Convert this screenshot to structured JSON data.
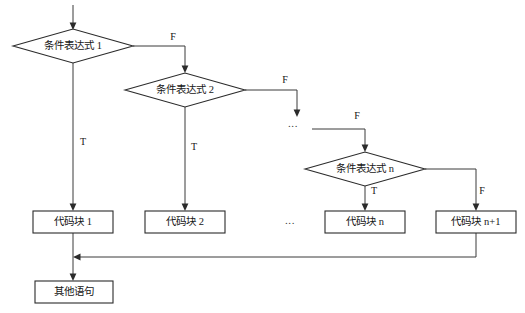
{
  "diagram": {
    "type": "flowchart",
    "title": "",
    "background_color": "#ffffff",
    "line_color": "#3a3a3a",
    "text_color": "#161616",
    "decisions": [
      {
        "id": "cond-1",
        "label": "条件表达式 1",
        "cx": 73,
        "cy": 46,
        "rx": 60,
        "ry": 17
      },
      {
        "id": "cond-2",
        "label": "条件表达式 2",
        "cx": 185,
        "cy": 90,
        "rx": 60,
        "ry": 17
      },
      {
        "id": "cond-n",
        "label": "条件表达式 n",
        "cx": 365,
        "cy": 169,
        "rx": 60,
        "ry": 17
      }
    ],
    "process_blocks": [
      {
        "id": "block-1",
        "label": "代码块 1",
        "x": 33,
        "y": 211,
        "w": 80,
        "h": 22
      },
      {
        "id": "block-2",
        "label": "代码块 2",
        "x": 145,
        "y": 211,
        "w": 80,
        "h": 22
      },
      {
        "id": "block-n",
        "label": "代码块 n",
        "x": 325,
        "y": 211,
        "w": 80,
        "h": 22
      },
      {
        "id": "block-n1",
        "label": "代码块 n+1",
        "x": 436,
        "y": 211,
        "w": 80,
        "h": 22
      },
      {
        "id": "block-end",
        "label": "其他语句",
        "x": 35,
        "y": 281,
        "w": 78,
        "h": 22
      }
    ],
    "branch_labels": [
      {
        "id": "f-1",
        "text": "F",
        "x": 173,
        "y": 38
      },
      {
        "id": "t-1",
        "text": "T",
        "x": 83,
        "y": 143
      },
      {
        "id": "f-2",
        "text": "F",
        "x": 285,
        "y": 81
      },
      {
        "id": "t-2",
        "text": "T",
        "x": 194,
        "y": 148
      },
      {
        "id": "f-3",
        "text": "F",
        "x": 357,
        "y": 117
      },
      {
        "id": "t-n",
        "text": "T",
        "x": 374,
        "y": 192
      },
      {
        "id": "f-n",
        "text": "F",
        "x": 482,
        "y": 192
      }
    ],
    "ellipses": [
      {
        "id": "ellipsis-top",
        "text": "...",
        "x": 293,
        "y": 124
      },
      {
        "id": "ellipsis-bottom",
        "text": "...",
        "x": 290,
        "y": 221
      }
    ]
  }
}
